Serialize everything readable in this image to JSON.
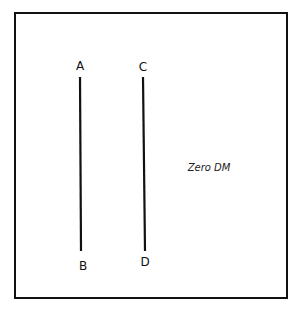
{
  "diagram": {
    "lines": [
      {
        "id": "AB",
        "start_label": "A",
        "end_label": "B"
      },
      {
        "id": "CD",
        "start_label": "C",
        "end_label": "D"
      }
    ],
    "annotation": "Zero DM",
    "colors": {
      "stroke": "#111111",
      "background": "#ffffff"
    }
  }
}
